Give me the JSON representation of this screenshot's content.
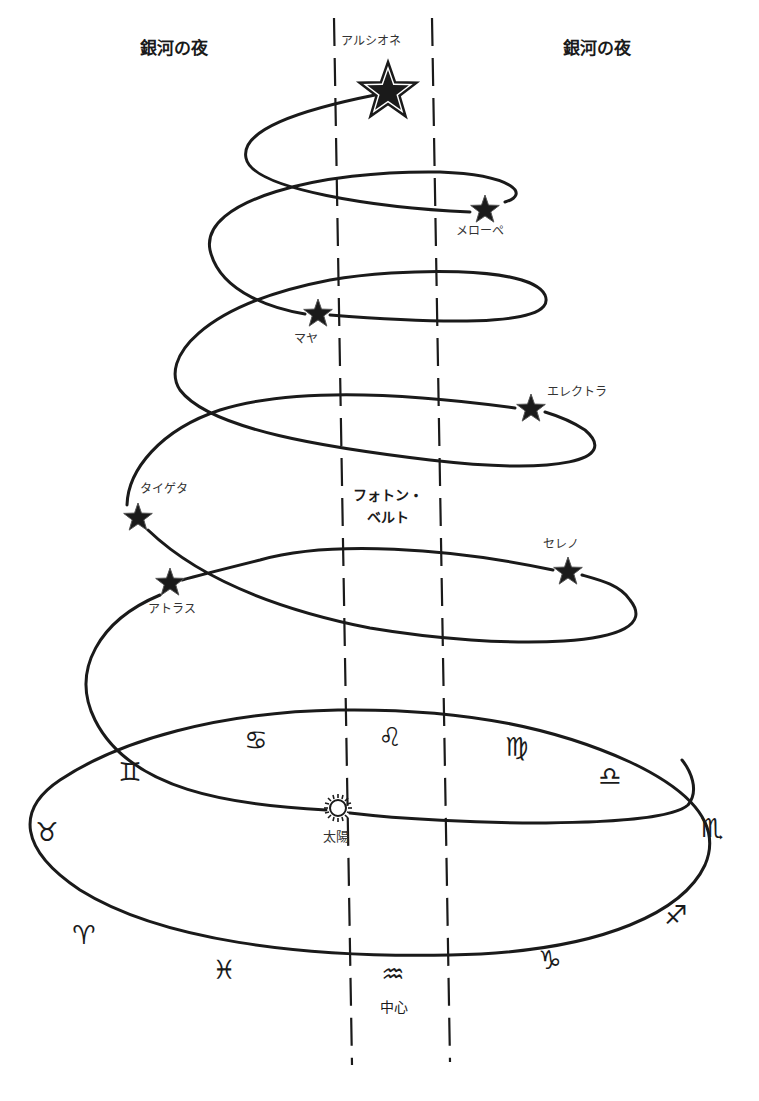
{
  "labels": {
    "galaxy_night_left": "銀河の夜",
    "galaxy_night_right": "銀河の夜",
    "photon_belt_line1": "フォトン・",
    "photon_belt_line2": "ベルト",
    "sun": "太陽",
    "center": "中心"
  },
  "stars": [
    {
      "name": "アルシオネ",
      "x": 388,
      "y": 92,
      "size": "large"
    },
    {
      "name": "メローペ",
      "x": 485,
      "y": 210
    },
    {
      "name": "マヤ",
      "x": 318,
      "y": 314
    },
    {
      "name": "エレクトラ",
      "x": 531,
      "y": 409
    },
    {
      "name": "タイゲタ",
      "x": 138,
      "y": 518
    },
    {
      "name": "アトラス",
      "x": 170,
      "y": 583
    },
    {
      "name": "セレノ",
      "x": 568,
      "y": 572
    }
  ],
  "zodiac": [
    {
      "name": "cancer",
      "glyph": "♋",
      "x": 256,
      "y": 740
    },
    {
      "name": "leo",
      "glyph": "♌",
      "x": 390,
      "y": 737
    },
    {
      "name": "virgo",
      "glyph": "♍",
      "x": 517,
      "y": 747
    },
    {
      "name": "libra",
      "glyph": "♎",
      "x": 610,
      "y": 776
    },
    {
      "name": "gemini",
      "glyph": "♊",
      "x": 130,
      "y": 772
    },
    {
      "name": "scorpio",
      "glyph": "♏",
      "x": 712,
      "y": 828
    },
    {
      "name": "taurus",
      "glyph": "♉",
      "x": 47,
      "y": 832
    },
    {
      "name": "sagittarius",
      "glyph": "♐",
      "x": 676,
      "y": 915
    },
    {
      "name": "aries",
      "glyph": "♈",
      "x": 84,
      "y": 935
    },
    {
      "name": "capricorn",
      "glyph": "♑",
      "x": 550,
      "y": 960
    },
    {
      "name": "pisces",
      "glyph": "♓",
      "x": 224,
      "y": 970
    },
    {
      "name": "aquarius",
      "glyph": "♒",
      "x": 393,
      "y": 974
    }
  ],
  "colors": {
    "ink": "#1a1a1a",
    "background": "#ffffff",
    "label": "#333333"
  }
}
